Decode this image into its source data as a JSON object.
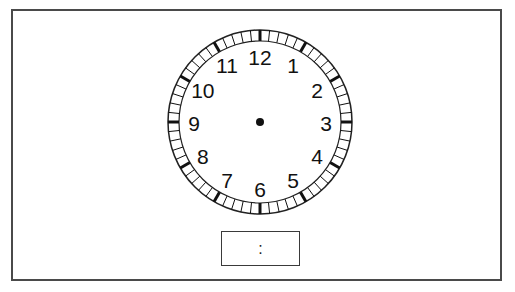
{
  "clock": {
    "numerals": [
      "12",
      "1",
      "2",
      "3",
      "4",
      "5",
      "6",
      "7",
      "8",
      "9",
      "10",
      "11"
    ],
    "minute_ticks": 60,
    "center_dot": true,
    "colors": {
      "ink": "#111111",
      "frame": "#4a4a4a",
      "background": "#ffffff"
    }
  },
  "time_box": {
    "value": ":"
  }
}
